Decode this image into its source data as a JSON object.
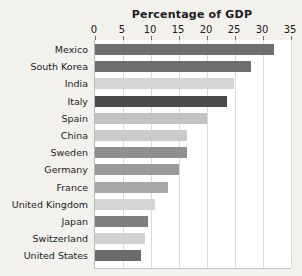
{
  "chart_data": {
    "type": "bar",
    "orientation": "horizontal",
    "title": "Percentage of GDP",
    "xlabel": "",
    "ylabel": "",
    "xlim": [
      0,
      35
    ],
    "xticks": [
      0,
      5,
      10,
      15,
      20,
      25,
      30,
      35
    ],
    "grid": true,
    "legend": "none",
    "categories": [
      "Mexico",
      "South Korea",
      "India",
      "Italy",
      "Spain",
      "China",
      "Sweden",
      "Germany",
      "France",
      "United Kingdom",
      "Japan",
      "Switzerland",
      "United States"
    ],
    "values": [
      31.9,
      27.8,
      24.9,
      23.5,
      20.0,
      16.5,
      16.5,
      15.0,
      13.0,
      10.8,
      9.4,
      8.9,
      8.2
    ],
    "bar_colors": [
      "#6f6f6f",
      "#6f6f6f",
      "#d5d5d5",
      "#4a4a4a",
      "#c2c2c2",
      "#cbcbcb",
      "#8f8f8f",
      "#9a9a9a",
      "#a8a8a8",
      "#d5d5d5",
      "#7e7e7e",
      "#d2d2d2",
      "#6b6b6b"
    ]
  },
  "colors": {
    "page_background": "#f2f1ee",
    "plot_background": "#ffffff",
    "gridline": "#d9d9d9",
    "axis": "#b9b9b9",
    "text": "#1b1b1b",
    "highlight_bar": "#4a4a4a"
  }
}
